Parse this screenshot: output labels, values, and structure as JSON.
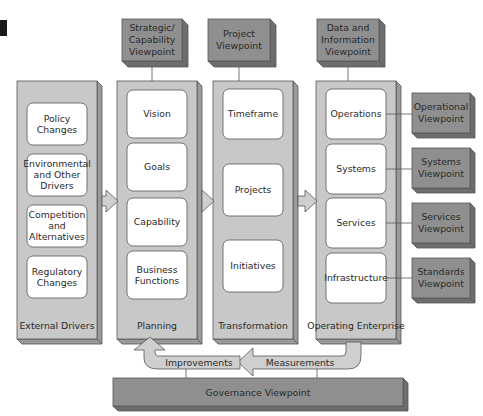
{
  "diagram": {
    "colors": {
      "column_fill": "#c8c8c8",
      "column_side": "#9a9a9a",
      "viewpoint_fill": "#8f8f8f",
      "viewpoint_side": "#6e6e6e",
      "box_fill": "#ffffff",
      "arrow_fill": "#cfcfcf",
      "stroke": "#555555",
      "marker": "#1a1a1a"
    },
    "top_viewpoints": [
      {
        "id": "strategic",
        "lines": [
          "Strategic/",
          "Capability",
          "Viewpoint"
        ]
      },
      {
        "id": "project",
        "lines": [
          "Project",
          "Viewpoint"
        ]
      },
      {
        "id": "data",
        "lines": [
          "Data and",
          "Information",
          "Viewpoint"
        ]
      }
    ],
    "columns": [
      {
        "id": "external-drivers",
        "label": "External Drivers",
        "items": [
          {
            "lines": [
              "Policy",
              "Changes"
            ]
          },
          {
            "lines": [
              "Environmental",
              "and Other",
              "Drivers"
            ]
          },
          {
            "lines": [
              "Competition",
              "and",
              "Alternatives"
            ]
          },
          {
            "lines": [
              "Regulatory",
              "Changes"
            ]
          }
        ]
      },
      {
        "id": "planning",
        "label": "Planning",
        "items": [
          {
            "lines": [
              "Vision"
            ]
          },
          {
            "lines": [
              "Goals"
            ]
          },
          {
            "lines": [
              "Capability"
            ]
          },
          {
            "lines": [
              "Business",
              "Functions"
            ]
          }
        ]
      },
      {
        "id": "transformation",
        "label": "Transformation",
        "items": [
          {
            "lines": [
              "Timeframe"
            ]
          },
          {
            "lines": [
              "Projects"
            ]
          },
          {
            "lines": [
              "Initiatives"
            ]
          }
        ]
      },
      {
        "id": "operating-enterprise",
        "label": "Operating Enterprise",
        "items": [
          {
            "lines": [
              "Operations"
            ]
          },
          {
            "lines": [
              "Systems"
            ]
          },
          {
            "lines": [
              "Services"
            ]
          },
          {
            "lines": [
              "Infrastructure"
            ]
          }
        ]
      }
    ],
    "side_viewpoints": [
      {
        "id": "operational",
        "lines": [
          "Operational",
          "Viewpoint"
        ]
      },
      {
        "id": "systems",
        "lines": [
          "Systems",
          "Viewpoint"
        ]
      },
      {
        "id": "services",
        "lines": [
          "Services",
          "Viewpoint"
        ]
      },
      {
        "id": "standards",
        "lines": [
          "Standards",
          "Viewpoint"
        ]
      }
    ],
    "feedback": {
      "improvements_label": "Improvements",
      "measurements_label": "Measurements"
    },
    "governance": {
      "label": "Governance Viewpoint"
    }
  }
}
